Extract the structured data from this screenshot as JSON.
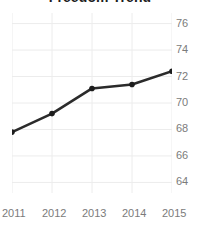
{
  "chart_data": {
    "type": "line",
    "title": "Freedom Trend",
    "xlabel": "",
    "ylabel": "",
    "categories": [
      "2011",
      "2012",
      "2013",
      "2014",
      "2015"
    ],
    "x": [
      2011,
      2012,
      2013,
      2014,
      2015
    ],
    "values": [
      67.8,
      69.2,
      71.1,
      71.4,
      72.4
    ],
    "series": [
      {
        "name": "Freedom Trend",
        "values": [
          67.8,
          69.2,
          71.1,
          71.4,
          72.4
        ]
      }
    ],
    "ylim": [
      63.2,
      76.8
    ],
    "xlim": [
      2011,
      2015
    ],
    "y_ticks": [
      64,
      66,
      68,
      70,
      72,
      74,
      76
    ],
    "y_tick_labels": [
      "64",
      "66",
      "68",
      "70",
      "72",
      "74",
      "76"
    ],
    "x_ticks": [
      2011,
      2012,
      2013,
      2014,
      2015
    ],
    "x_tick_labels": [
      "2011",
      "2012",
      "2013",
      "2014",
      "2015"
    ],
    "grid": true,
    "grid_axis": "both",
    "legend": false,
    "legend_position": "none",
    "y_axis_position": "right",
    "markers": true,
    "colors": {
      "line": "#2b2b2b",
      "marker": "#1d1d1d",
      "grid": "#ececec",
      "background": "#ffffff",
      "title_text": "#1d1d1d",
      "tick_text": "#7b7b7b"
    }
  }
}
